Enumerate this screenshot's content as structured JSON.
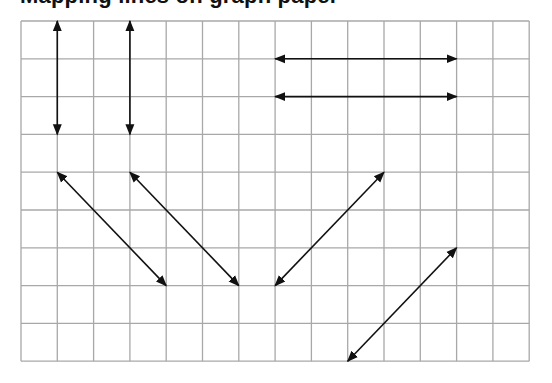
{
  "title": "Mapping lines on graph paper",
  "grid": {
    "origin": [
      21,
      21
    ],
    "cell_width": 36.3,
    "cell_height": 37.8,
    "columns": 14,
    "rows": 9,
    "line_color": "#a8a8a8",
    "arrow_color": "#111111"
  },
  "arrows": [
    {
      "name": "vertical-arrow-1",
      "from": [
        1,
        0
      ],
      "to": [
        1,
        3
      ]
    },
    {
      "name": "vertical-arrow-2",
      "from": [
        3,
        0
      ],
      "to": [
        3,
        3
      ]
    },
    {
      "name": "horizontal-arrow-1",
      "from": [
        7,
        1
      ],
      "to": [
        12,
        1
      ]
    },
    {
      "name": "horizontal-arrow-2",
      "from": [
        7,
        2
      ],
      "to": [
        12,
        2
      ]
    },
    {
      "name": "diagonal-arrow-1",
      "from": [
        1,
        4
      ],
      "to": [
        4,
        7
      ]
    },
    {
      "name": "diagonal-arrow-2",
      "from": [
        3,
        4
      ],
      "to": [
        6,
        7
      ]
    },
    {
      "name": "diagonal-arrow-3",
      "from": [
        10,
        4
      ],
      "to": [
        7,
        7
      ]
    },
    {
      "name": "diagonal-arrow-4",
      "from": [
        12,
        6
      ],
      "to": [
        9,
        9
      ]
    }
  ]
}
